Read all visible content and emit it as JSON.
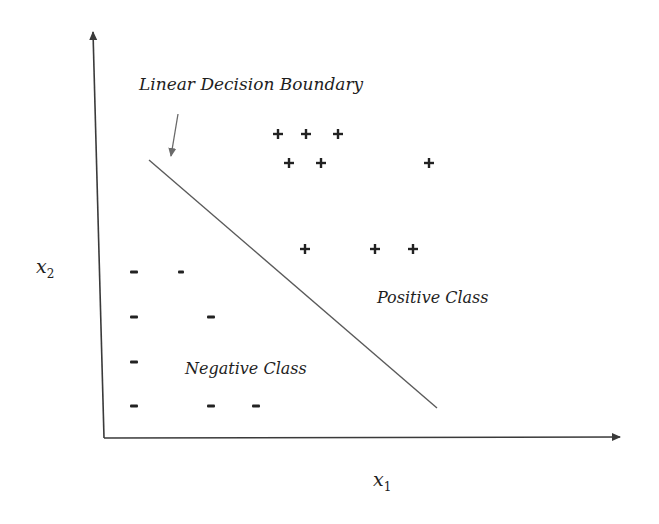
{
  "diagram": {
    "title_annotation": "Linear Decision Boundary",
    "x_axis_label": "x",
    "x_axis_subscript": "1",
    "y_axis_label": "x",
    "y_axis_subscript": "2",
    "positive_region_label": "Positive Class",
    "negative_region_label": "Negative Class",
    "positive_symbol": "+",
    "negative_symbol": "-",
    "colors": {
      "axis": "#3a3a3a",
      "boundary": "#5a5a5a",
      "arrow": "#6a6a6a",
      "text": "#1e1e1e",
      "background": "#ffffff"
    }
  },
  "chart_data": {
    "type": "scatter",
    "title": "Linear Decision Boundary",
    "xlabel": "x1",
    "ylabel": "x2",
    "series": [
      {
        "name": "Positive Class",
        "marker": "+",
        "points_px": [
          [
            278,
            134
          ],
          [
            306,
            134
          ],
          [
            338,
            134
          ],
          [
            289,
            163
          ],
          [
            321,
            163
          ],
          [
            429,
            163
          ],
          [
            305,
            249
          ],
          [
            375,
            249
          ],
          [
            413,
            249
          ]
        ]
      },
      {
        "name": "Negative Class",
        "marker": "-",
        "points_px": [
          [
            134,
            272
          ],
          [
            181,
            272
          ],
          [
            134,
            317
          ],
          [
            211,
            317
          ],
          [
            134,
            362
          ],
          [
            134,
            406
          ],
          [
            211,
            406
          ],
          [
            256,
            406
          ]
        ]
      }
    ],
    "boundary_line_px": [
      [
        149,
        160
      ],
      [
        437,
        408
      ]
    ],
    "annotations": [
      "Linear Decision Boundary",
      "Positive Class",
      "Negative Class"
    ],
    "grid": false
  }
}
